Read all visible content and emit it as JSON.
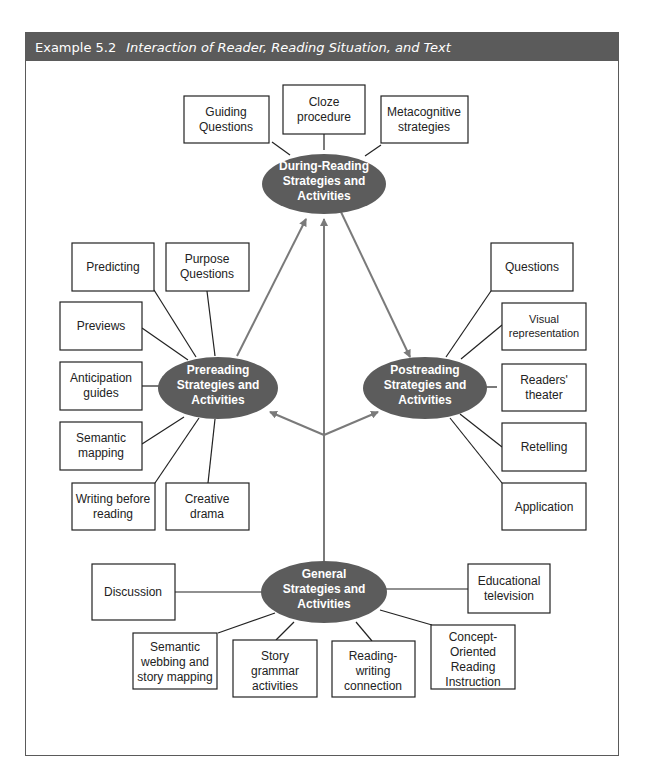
{
  "header": {
    "example_number": "Example 5.2",
    "title": "Interaction of Reader, Reading Situation, and Text",
    "bar_color": "#5b5b5b"
  },
  "hubs": {
    "during": {
      "lines": [
        "During-Reading",
        "Strategies and",
        "Activities"
      ]
    },
    "prereading": {
      "lines": [
        "Prereading",
        "Strategies and",
        "Activities"
      ]
    },
    "postreading": {
      "lines": [
        "Postreading",
        "Strategies and",
        "Activities"
      ]
    },
    "general": {
      "lines": [
        "General",
        "Strategies and",
        "Activities"
      ]
    }
  },
  "during_items": [
    {
      "lines": [
        "Guiding",
        "Questions"
      ]
    },
    {
      "lines": [
        "Cloze",
        "procedure"
      ]
    },
    {
      "lines": [
        "Metacognitive",
        "strategies"
      ]
    }
  ],
  "prereading_items": [
    {
      "lines": [
        "Predicting"
      ]
    },
    {
      "lines": [
        "Purpose",
        "Questions"
      ]
    },
    {
      "lines": [
        "Previews"
      ]
    },
    {
      "lines": [
        "Anticipation",
        "guides"
      ]
    },
    {
      "lines": [
        "Semantic",
        "mapping"
      ]
    },
    {
      "lines": [
        "Writing before",
        "reading"
      ]
    },
    {
      "lines": [
        "Creative",
        "drama"
      ]
    }
  ],
  "postreading_items": [
    {
      "lines": [
        "Questions"
      ]
    },
    {
      "lines": [
        "Visual",
        "representation"
      ]
    },
    {
      "lines": [
        "Readers'",
        "theater"
      ]
    },
    {
      "lines": [
        "Retelling"
      ]
    },
    {
      "lines": [
        "Application"
      ]
    }
  ],
  "general_items": [
    {
      "lines": [
        "Discussion"
      ]
    },
    {
      "lines": [
        "Educational",
        "television"
      ]
    },
    {
      "lines": [
        "Semantic",
        "webbing and",
        "story mapping"
      ]
    },
    {
      "lines": [
        "Story",
        "grammar",
        "activities"
      ]
    },
    {
      "lines": [
        "Reading-",
        "writing",
        "connection"
      ]
    },
    {
      "lines": [
        "Concept-",
        "Oriented",
        "Reading",
        "Instruction"
      ]
    }
  ]
}
